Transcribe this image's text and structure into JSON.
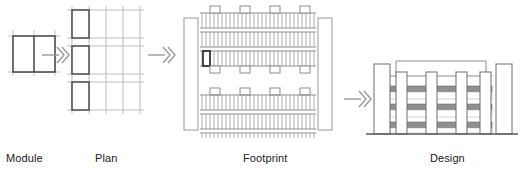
{
  "diagram": {
    "background_color": "#ffffff",
    "line_color_dark": "#3a3a3a",
    "line_color_mid": "#6e6e6e",
    "line_color_light": "#b8b8b8",
    "arrow_color": "#9a9a9a",
    "text_color": "#1a1a1a"
  },
  "labels": {
    "module": "Module",
    "plan": "Plan",
    "footprint": "Footprint",
    "design": "Design"
  },
  "stages": [
    {
      "key": "module",
      "label": "Module",
      "description": "Single rectangular unit split into two bays by a centre line, with light construction extension lines",
      "cells": 2,
      "width_px": 44,
      "height_px": 37
    },
    {
      "key": "plan",
      "label": "Plan",
      "description": "Three stacked grid rows, each four modules wide, with the first module outlined dark",
      "rows": 3,
      "columns": 4,
      "highlighted_cell": 1
    },
    {
      "key": "footprint",
      "label": "Footprint",
      "description": "Site plan with two vertical circulation cores flanking six horizontal module bands and eight small core squares",
      "bands": 6,
      "band_groups": 2,
      "bands_per_group": 3,
      "modules_per_band": 30,
      "core_squares": 8,
      "side_cores": 2,
      "highlighted_module": 1
    },
    {
      "key": "design",
      "label": "Design",
      "description": "Elevation showing six vertical towers, three stacked striped floor bands and a roof beam spanning the inner towers",
      "towers": 6,
      "floor_bands": 3,
      "roof_beam": true,
      "ground_line": true
    }
  ],
  "arrows": [
    {
      "name": "arrow-module-to-plan",
      "from": "module",
      "to": "plan",
      "glyph": "double-chevron"
    },
    {
      "name": "arrow-plan-to-footprint",
      "from": "plan",
      "to": "footprint",
      "glyph": "double-chevron"
    },
    {
      "name": "arrow-footprint-to-design",
      "from": "footprint",
      "to": "design",
      "glyph": "double-chevron"
    }
  ]
}
